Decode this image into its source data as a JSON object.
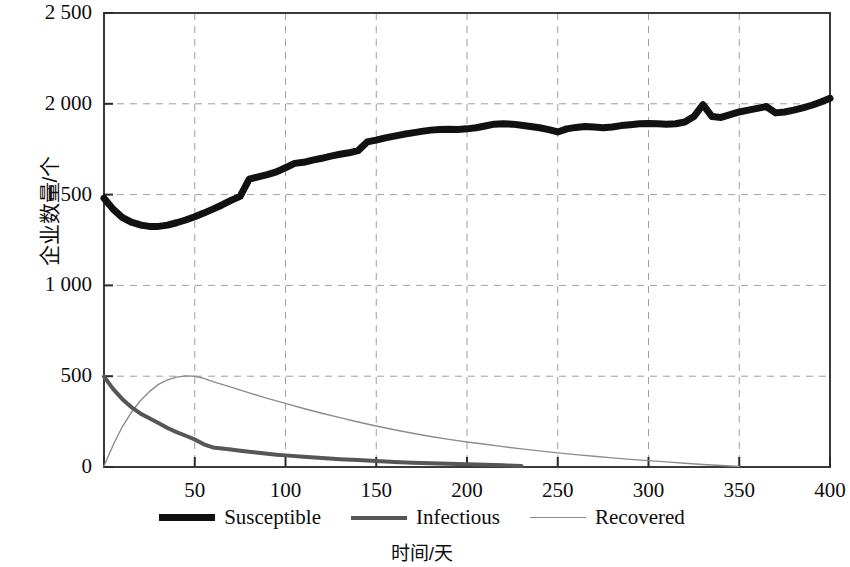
{
  "chart_data": {
    "type": "line",
    "title": "",
    "xlabel": "时间/天",
    "ylabel": "企业数量/个",
    "xlim": [
      0,
      400
    ],
    "ylim": [
      0,
      2500
    ],
    "grid": true,
    "grid_style": "dashed",
    "legend_position": "bottom",
    "x_ticks": [
      0,
      50,
      100,
      150,
      200,
      250,
      300,
      350,
      400
    ],
    "x_tick_labels": [
      "",
      "50",
      "100",
      "150",
      "200",
      "250",
      "300",
      "350",
      "400"
    ],
    "y_ticks": [
      0,
      500,
      1000,
      1500,
      2000,
      2500
    ],
    "y_tick_labels": [
      "0",
      "500",
      "1 000",
      "1 500",
      "2 000",
      "2 500"
    ],
    "series": [
      {
        "name": "Susceptible",
        "color": "#111111",
        "width": 7,
        "x": [
          0,
          5,
          10,
          15,
          20,
          25,
          30,
          35,
          40,
          45,
          50,
          55,
          60,
          65,
          70,
          75,
          80,
          85,
          90,
          95,
          100,
          105,
          110,
          115,
          120,
          125,
          130,
          135,
          140,
          145,
          150,
          155,
          160,
          165,
          170,
          175,
          180,
          185,
          190,
          195,
          200,
          205,
          210,
          215,
          220,
          225,
          230,
          235,
          240,
          245,
          250,
          255,
          260,
          265,
          270,
          275,
          280,
          285,
          290,
          295,
          300,
          305,
          310,
          315,
          320,
          325,
          330,
          335,
          340,
          345,
          350,
          355,
          360,
          365,
          370,
          375,
          380,
          385,
          390,
          395,
          400
        ],
        "y": [
          1480,
          1420,
          1375,
          1348,
          1333,
          1325,
          1325,
          1332,
          1345,
          1360,
          1378,
          1398,
          1420,
          1443,
          1468,
          1490,
          1585,
          1598,
          1610,
          1625,
          1648,
          1672,
          1678,
          1690,
          1700,
          1712,
          1722,
          1730,
          1742,
          1790,
          1800,
          1812,
          1822,
          1832,
          1840,
          1848,
          1855,
          1858,
          1860,
          1858,
          1862,
          1868,
          1878,
          1888,
          1890,
          1888,
          1882,
          1875,
          1868,
          1858,
          1845,
          1862,
          1870,
          1875,
          1872,
          1868,
          1872,
          1880,
          1885,
          1890,
          1892,
          1890,
          1888,
          1890,
          1900,
          1930,
          1995,
          1930,
          1925,
          1940,
          1955,
          1965,
          1975,
          1985,
          1950,
          1955,
          1965,
          1978,
          1992,
          2010,
          2030
        ]
      },
      {
        "name": "Infectious",
        "color": "#565656",
        "width": 4,
        "x": [
          0,
          5,
          10,
          15,
          20,
          25,
          30,
          35,
          40,
          45,
          50,
          55,
          60,
          65,
          70,
          75,
          80,
          85,
          90,
          95,
          100,
          110,
          120,
          130,
          140,
          150,
          160,
          170,
          180,
          190,
          200,
          210,
          220,
          230
        ],
        "y": [
          498,
          430,
          375,
          330,
          295,
          268,
          242,
          215,
          192,
          172,
          152,
          125,
          108,
          102,
          96,
          90,
          84,
          78,
          73,
          68,
          64,
          56,
          49,
          43,
          38,
          33,
          28,
          24,
          21,
          18,
          15,
          12,
          9,
          5
        ]
      },
      {
        "name": "Recovered",
        "color": "#8c8c8c",
        "width": 1.4,
        "x": [
          0,
          5,
          10,
          15,
          20,
          25,
          30,
          35,
          40,
          45,
          50,
          55,
          60,
          70,
          80,
          90,
          100,
          110,
          120,
          130,
          140,
          150,
          160,
          170,
          180,
          190,
          200,
          210,
          220,
          230,
          240,
          250,
          260,
          270,
          280,
          290,
          300,
          310,
          320,
          330,
          340,
          350
        ],
        "y": [
          5,
          120,
          220,
          300,
          365,
          415,
          455,
          480,
          495,
          502,
          500,
          488,
          470,
          440,
          408,
          378,
          350,
          322,
          296,
          272,
          248,
          226,
          205,
          186,
          168,
          152,
          138,
          125,
          112,
          100,
          89,
          78,
          68,
          59,
          50,
          42,
          35,
          28,
          21,
          14,
          8,
          3
        ]
      }
    ]
  },
  "legend": {
    "items": [
      {
        "label": "Susceptible",
        "style": "thick"
      },
      {
        "label": "Infectious",
        "style": "medium"
      },
      {
        "label": "Recovered",
        "style": "thin"
      }
    ]
  }
}
